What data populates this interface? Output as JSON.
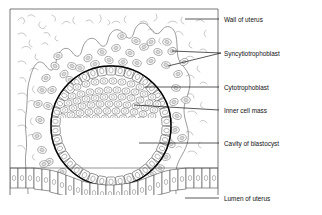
{
  "figure": {
    "background_color": "#ffffff",
    "line_color": "#111111"
  },
  "labels": [
    {
      "id": "wall-of-uterus",
      "text": "Wall of uterus",
      "x": 224,
      "y": 21,
      "leader": [
        [
          185,
          19
        ],
        [
          219,
          19
        ]
      ]
    },
    {
      "id": "syncytiotrophoblast",
      "text": "Syncytiotrophoblast",
      "x": 224,
      "y": 55,
      "leader": [
        [
          221,
          53
        ],
        [
          168,
          66
        ]
      ],
      "leader2": [
        [
          221,
          53
        ],
        [
          172,
          51
        ]
      ]
    },
    {
      "id": "cytotrophoblast",
      "text": "Cytotrophoblast",
      "x": 224,
      "y": 89,
      "leader": [
        [
          145,
          87
        ],
        [
          219,
          87
        ]
      ]
    },
    {
      "id": "inner-cell-mass",
      "text": "Inner cell mass",
      "x": 224,
      "y": 112,
      "leader": [
        [
          134,
          105
        ],
        [
          219,
          110
        ]
      ]
    },
    {
      "id": "cavity-of-blastocyst",
      "text": "Cavity of blastocyst",
      "x": 224,
      "y": 145,
      "leader": [
        [
          139,
          143
        ],
        [
          219,
          143
        ]
      ]
    },
    {
      "id": "lumen-of-uterus",
      "text": "Lumen of uterus",
      "x": 224,
      "y": 200,
      "leader": [
        [
          185,
          198
        ],
        [
          219,
          198
        ]
      ]
    }
  ],
  "structures": {
    "frame": {
      "x": 10,
      "y": 9,
      "width": 208,
      "height": 186
    },
    "blastocyst": {
      "cx": 111,
      "cy": 126,
      "r": 60
    },
    "trophoblast_cells": 38,
    "inner_cell_mass_cells": 74,
    "syncytiotrophoblast_cells": 46,
    "epithelium_cells": 34,
    "stroma_marks": 58
  },
  "colors": {
    "blastocyst_outline": "#000000",
    "syncytium_nucleus": "#d9d9d9",
    "stroma": "#9a9a9a",
    "frame": "#555555"
  }
}
